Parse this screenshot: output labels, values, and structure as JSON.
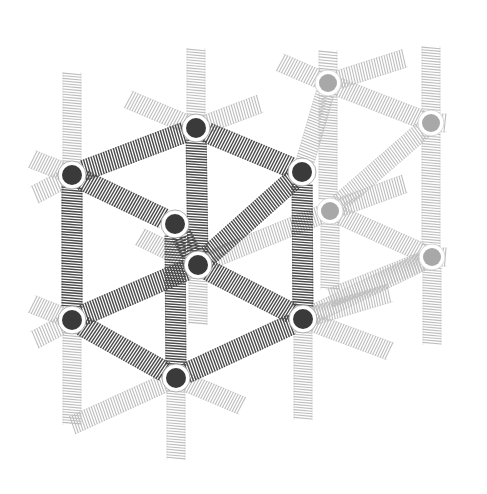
{
  "diagram": {
    "title": "Cubic spring-mass lattice",
    "colors": {
      "background": "#ffffff",
      "dark_spring": "#4a4a4a",
      "dark_node": "#3a3a3a",
      "light_spring": "#bdbdbd",
      "light_node": "#a8a8a8"
    },
    "dark_nodes": [
      {
        "id": "A",
        "x": 72,
        "y": 175
      },
      {
        "id": "B",
        "x": 196,
        "y": 128
      },
      {
        "id": "C",
        "x": 302,
        "y": 172
      },
      {
        "id": "D",
        "x": 175,
        "y": 224
      },
      {
        "id": "E",
        "x": 198,
        "y": 265
      },
      {
        "id": "F",
        "x": 72,
        "y": 320
      },
      {
        "id": "G",
        "x": 303,
        "y": 319
      },
      {
        "id": "H",
        "x": 176,
        "y": 378
      }
    ],
    "light_nodes": [
      {
        "id": "L1",
        "x": 328,
        "y": 83
      },
      {
        "id": "L2",
        "x": 431,
        "y": 123
      },
      {
        "id": "L3",
        "x": 330,
        "y": 211
      },
      {
        "id": "L4",
        "x": 432,
        "y": 257
      }
    ],
    "dark_springs": [
      [
        "A",
        "B"
      ],
      [
        "B",
        "C"
      ],
      [
        "A",
        "D"
      ],
      [
        "C",
        "E"
      ],
      [
        "D",
        "E"
      ],
      [
        "A",
        "F"
      ],
      [
        "B",
        "E"
      ],
      [
        "C",
        "G"
      ],
      [
        "D",
        "H"
      ],
      [
        "F",
        "E"
      ],
      [
        "E",
        "G"
      ],
      [
        "F",
        "H"
      ],
      [
        "H",
        "G"
      ]
    ],
    "light_springs": [
      [
        72,
        175,
        72,
        62
      ],
      [
        72,
        175,
        22,
        155
      ],
      [
        72,
        175,
        25,
        200
      ],
      [
        196,
        128,
        196,
        38
      ],
      [
        196,
        128,
        118,
        95
      ],
      [
        196,
        128,
        270,
        100
      ],
      [
        72,
        320,
        72,
        435
      ],
      [
        72,
        320,
        22,
        300
      ],
      [
        72,
        320,
        25,
        345
      ],
      [
        176,
        378,
        176,
        470
      ],
      [
        176,
        378,
        62,
        430
      ],
      [
        176,
        378,
        252,
        410
      ],
      [
        303,
        319,
        303,
        430
      ],
      [
        303,
        319,
        400,
        355
      ],
      [
        303,
        319,
        400,
        290
      ],
      [
        198,
        265,
        198,
        335
      ],
      [
        198,
        265,
        130,
        232
      ],
      [
        198,
        265,
        330,
        211
      ],
      [
        328,
        83,
        328,
        40
      ],
      [
        328,
        83,
        270,
        58
      ],
      [
        328,
        83,
        415,
        55
      ],
      [
        328,
        83,
        431,
        123
      ],
      [
        328,
        83,
        328,
        211
      ],
      [
        302,
        172,
        328,
        83
      ],
      [
        431,
        123,
        431,
        36
      ],
      [
        431,
        123,
        457,
        123
      ],
      [
        431,
        123,
        330,
        211
      ],
      [
        431,
        123,
        431,
        257
      ],
      [
        330,
        211,
        330,
        300
      ],
      [
        330,
        211,
        415,
        180
      ],
      [
        330,
        211,
        432,
        257
      ],
      [
        432,
        257,
        432,
        355
      ],
      [
        432,
        257,
        457,
        257
      ],
      [
        432,
        257,
        320,
        302
      ],
      [
        303,
        319,
        432,
        257
      ]
    ]
  }
}
